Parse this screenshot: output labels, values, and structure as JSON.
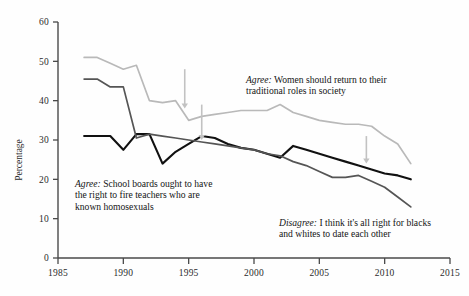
{
  "chart_data": {
    "type": "line",
    "title": "",
    "xlabel": "",
    "ylabel": "Percentage",
    "xlim": [
      1985,
      2015
    ],
    "ylim": [
      0,
      60
    ],
    "xticks": [
      1985,
      1990,
      1995,
      2000,
      2005,
      2010,
      2015
    ],
    "yticks": [
      0,
      10,
      20,
      30,
      40,
      50,
      60
    ],
    "grid": false,
    "legend_position": "inline-annotations",
    "series": [
      {
        "name": "Agree: Women should return to their traditional roles in society",
        "color": "#b9b9b9",
        "x": [
          1987,
          1988,
          1989,
          1990,
          1991,
          1992,
          1993,
          1994,
          1995,
          1996,
          1997,
          1998,
          1999,
          2000,
          2001,
          2002,
          2003,
          2004,
          2005,
          2006,
          2007,
          2008,
          2009,
          2010,
          2011,
          2012
        ],
        "values": [
          51.0,
          51.0,
          49.5,
          48.0,
          49.0,
          40.0,
          39.5,
          40.0,
          35.0,
          36.0,
          36.5,
          37.0,
          37.5,
          37.5,
          37.5,
          39.0,
          37.0,
          36.0,
          35.0,
          34.5,
          34.0,
          34.0,
          33.5,
          31.0,
          29.0,
          24.0
        ]
      },
      {
        "name": "Agree: School boards ought to have the right to fire teachers who are known homosexuals",
        "color": "#111111",
        "x": [
          1987,
          1988,
          1989,
          1990,
          1991,
          1992,
          1993,
          1994,
          1995,
          1996,
          1997,
          1998,
          1999,
          2000,
          2001,
          2002,
          2003,
          2004,
          2005,
          2006,
          2007,
          2008,
          2009,
          2010,
          2011,
          2012
        ],
        "values": [
          31.0,
          31.0,
          31.0,
          27.5,
          31.5,
          31.5,
          24.0,
          27.0,
          29.0,
          31.0,
          30.5,
          29.0,
          28.0,
          27.5,
          26.5,
          25.5,
          28.5,
          27.5,
          26.5,
          25.5,
          24.5,
          23.5,
          22.5,
          21.5,
          21.0,
          20.0
        ]
      },
      {
        "name": "Disagree: I think it's all right for blacks and whites to date each other",
        "color": "#555555",
        "x": [
          1987,
          1988,
          1989,
          1990,
          1991,
          1992,
          1993,
          1994,
          1995,
          1996,
          1997,
          1998,
          1999,
          2000,
          2001,
          2002,
          2003,
          2004,
          2005,
          2006,
          2007,
          2008,
          2009,
          2010,
          2011,
          2012
        ],
        "values": [
          45.5,
          45.5,
          43.5,
          43.5,
          30.5,
          31.5,
          31.0,
          30.5,
          30.0,
          29.5,
          29.0,
          28.5,
          28.0,
          27.5,
          26.5,
          26.0,
          24.5,
          23.5,
          22.0,
          20.5,
          20.5,
          21.0,
          19.5,
          18.0,
          15.5,
          13.0
        ]
      }
    ],
    "annotations": [
      {
        "id": "women",
        "emphasis": "Agree:",
        "text": " Women should return to their traditional roles in society"
      },
      {
        "id": "school",
        "emphasis": "Agree:",
        "text": " School boards ought to have the right to fire teachers who are known homosexuals"
      },
      {
        "id": "disagree",
        "emphasis": "Disagree:",
        "text": " I think it's all right for blacks and whites to date each other"
      }
    ],
    "arrows": [
      {
        "name": "arrow-to-women-line",
        "x": 1994.7,
        "y_top": 48,
        "y_bottom": 38
      },
      {
        "name": "arrow-to-school-line",
        "x": 1996.0,
        "y_top": 39,
        "y_bottom": 30
      },
      {
        "name": "arrow-to-school-line-right",
        "x": 2008.6,
        "y_top": 31,
        "y_bottom": 24
      }
    ]
  },
  "axis": {
    "y_label": "Percentage",
    "y_ticks": [
      "0",
      "10",
      "20",
      "30",
      "40",
      "50",
      "60"
    ],
    "x_ticks": [
      "1985",
      "1990",
      "1995",
      "2000",
      "2005",
      "2010",
      "2015"
    ]
  },
  "colors": {
    "women_line": "#b9b9b9",
    "school_line": "#111111",
    "disagree_line": "#555555",
    "axis": "#4a4a4a",
    "background": "#fefefe"
  }
}
